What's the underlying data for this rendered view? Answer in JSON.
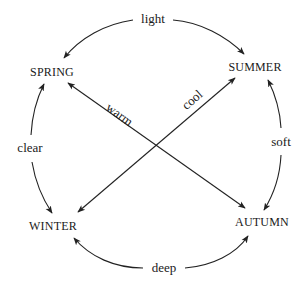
{
  "diagram": {
    "type": "cycle-with-cross-links",
    "nodes": [
      {
        "id": "spring",
        "label": "SPRING"
      },
      {
        "id": "summer",
        "label": "SUMMER"
      },
      {
        "id": "winter",
        "label": "WINTER"
      },
      {
        "id": "autumn",
        "label": "AUTUMN"
      }
    ],
    "edges": [
      {
        "from": "light",
        "to": [
          "spring",
          "summer"
        ],
        "label": "light"
      },
      {
        "from": "clear",
        "to": [
          "spring",
          "winter"
        ],
        "label": "clear"
      },
      {
        "from": "soft",
        "to": [
          "summer",
          "autumn"
        ],
        "label": "soft"
      },
      {
        "from": "deep",
        "to": [
          "winter",
          "autumn"
        ],
        "label": "deep"
      },
      {
        "between": [
          "spring",
          "autumn"
        ],
        "label": "warm",
        "bidirectional": true
      },
      {
        "between": [
          "summer",
          "winter"
        ],
        "label": "cool",
        "bidirectional": true
      }
    ]
  },
  "labels": {
    "spring": "SPRING",
    "summer": "SUMMER",
    "winter": "WINTER",
    "autumn": "AUTUMN",
    "light": "light",
    "clear": "clear",
    "soft": "soft",
    "deep": "deep",
    "warm": "warm",
    "cool": "cool"
  },
  "colors": {
    "ink": "#1a1a1a",
    "background": "#ffffff"
  }
}
